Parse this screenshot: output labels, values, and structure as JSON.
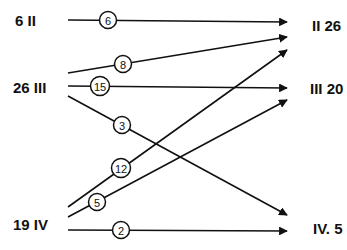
{
  "diagram": {
    "type": "flow-network",
    "left_nodes": [
      {
        "id": "II",
        "label": "6 II",
        "x": 15,
        "y": 26
      },
      {
        "id": "III",
        "label": "26 III",
        "x": 13,
        "y": 93
      },
      {
        "id": "IV",
        "label": "19 IV",
        "x": 13,
        "y": 230
      }
    ],
    "right_nodes": [
      {
        "id": "II",
        "label": "II 26",
        "x": 312,
        "y": 31
      },
      {
        "id": "III",
        "label": "III 20",
        "x": 310,
        "y": 94
      },
      {
        "id": "IV",
        "label": "IV. 5",
        "x": 313,
        "y": 234
      }
    ],
    "edges": [
      {
        "from": "II",
        "to": "II",
        "label": "6",
        "x1": 68,
        "y1": 20,
        "x2": 287,
        "y2": 22,
        "cx": 108,
        "cy": 20
      },
      {
        "from": "III",
        "to": "II",
        "label": "8",
        "x1": 68,
        "y1": 73,
        "x2": 287,
        "y2": 37,
        "cx": 123,
        "cy": 64
      },
      {
        "from": "III",
        "to": "III",
        "label": "15",
        "x1": 68,
        "y1": 86,
        "x2": 287,
        "y2": 88,
        "cx": 100,
        "cy": 86
      },
      {
        "from": "III",
        "to": "IV",
        "label": "3",
        "x1": 68,
        "y1": 96,
        "x2": 287,
        "y2": 215,
        "cx": 122,
        "cy": 125
      },
      {
        "from": "IV",
        "to": "II",
        "label": "12",
        "x1": 68,
        "y1": 207,
        "x2": 287,
        "y2": 50,
        "cx": 121,
        "cy": 168
      },
      {
        "from": "IV",
        "to": "III",
        "label": "5",
        "x1": 68,
        "y1": 217,
        "x2": 287,
        "y2": 100,
        "cx": 97,
        "cy": 202
      },
      {
        "from": "IV",
        "to": "IV",
        "label": "2",
        "x1": 68,
        "y1": 230,
        "x2": 287,
        "y2": 231,
        "cx": 121,
        "cy": 230
      }
    ]
  }
}
